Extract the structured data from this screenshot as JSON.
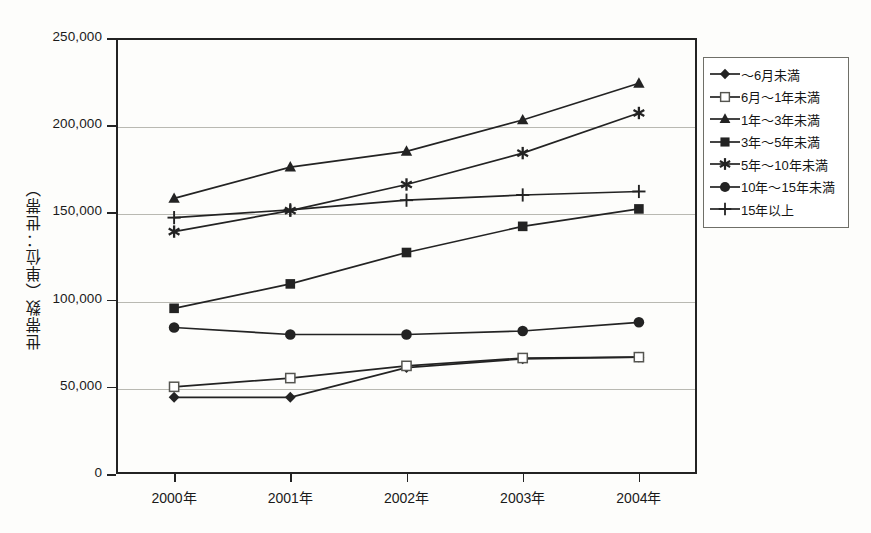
{
  "chart_data": {
    "type": "line",
    "title": "",
    "xlabel": "",
    "ylabel": "世帯数（単位：世帯）",
    "categories": [
      "2000年",
      "2001年",
      "2002年",
      "2003年",
      "2004年"
    ],
    "ylim": [
      0,
      250000
    ],
    "ytick_labels": [
      "0",
      "50,000",
      "100,000",
      "150,000",
      "200,000",
      "250,000"
    ],
    "ytick_values": [
      0,
      50000,
      100000,
      150000,
      200000,
      250000
    ],
    "grid": true,
    "legend_position": "right",
    "series": [
      {
        "name": "～6月未満",
        "marker": "diamond-filled",
        "values": [
          44000,
          44000,
          61000,
          66000,
          67000
        ]
      },
      {
        "name": "6月～1年未満",
        "marker": "square-open",
        "values": [
          50000,
          55000,
          62000,
          66500,
          67000
        ]
      },
      {
        "name": "1年～3年未満",
        "marker": "triangle-filled",
        "values": [
          158000,
          176000,
          185000,
          203000,
          224000
        ]
      },
      {
        "name": "3年～5年未満",
        "marker": "square-filled",
        "values": [
          95000,
          109000,
          127000,
          142000,
          152000
        ]
      },
      {
        "name": "5年～10年未満",
        "marker": "star-six",
        "values": [
          139000,
          151000,
          166000,
          184000,
          207000
        ]
      },
      {
        "name": "10年～15年未満",
        "marker": "circle-filled",
        "values": [
          84000,
          80000,
          80000,
          82000,
          87000
        ]
      },
      {
        "name": "15年以上",
        "marker": "plus",
        "values": [
          147000,
          151500,
          157000,
          160000,
          162000
        ]
      }
    ]
  },
  "colors": {
    "ink": "#232323",
    "grid": "#b9b9b2",
    "legend_border": "#6f6f68",
    "background": "#fdfdfb"
  }
}
